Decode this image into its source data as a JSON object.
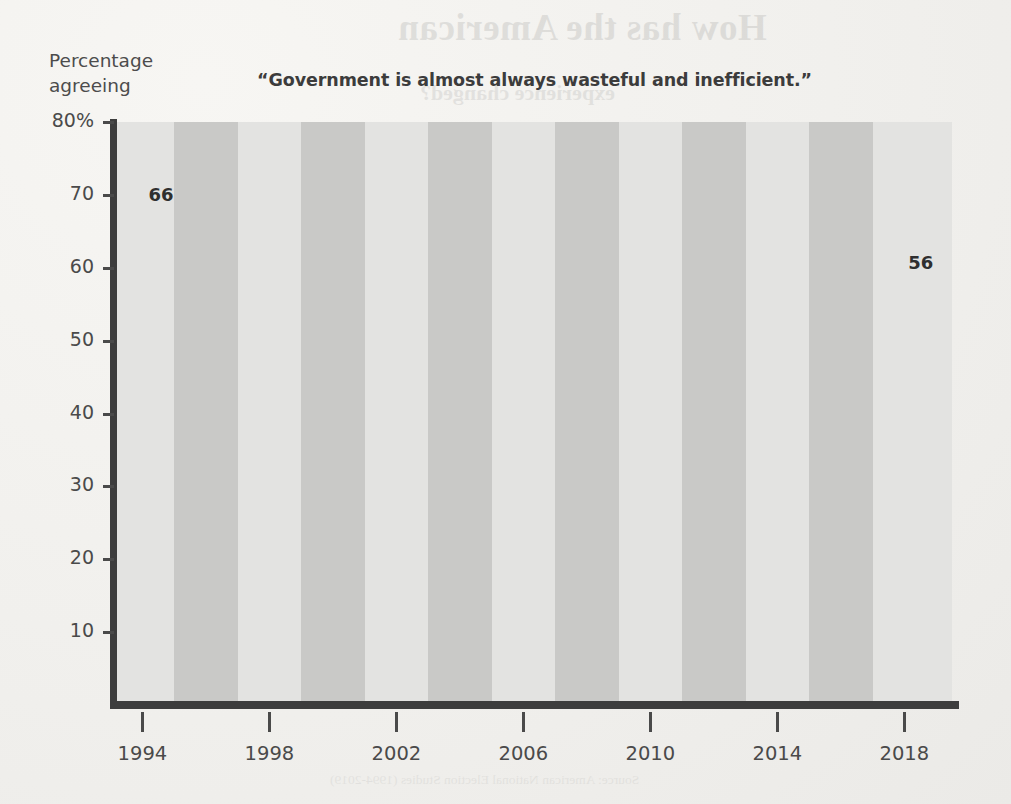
{
  "page": {
    "background_color": "#f3f2ef",
    "ghost_texts": [
      {
        "text": "How has the American",
        "kind": "head",
        "left": 398,
        "top": 6
      },
      {
        "text": "experience changed?",
        "kind": "sub",
        "left": 420,
        "top": 80
      },
      {
        "text": "Americans have long been skeptical of government power.",
        "kind": "body",
        "left": 360,
        "top": 170
      },
      {
        "text": "That skepticism, however, has not been constant over time.",
        "kind": "body",
        "left": 360,
        "top": 192
      },
      {
        "text": "Trust in federal institutions reached a postwar peak in the",
        "kind": "body",
        "left": 360,
        "top": 214
      },
      {
        "text": "mid-1960s and then fell sharply through the 1970s.",
        "kind": "body",
        "left": 360,
        "top": 236
      },
      {
        "text": "Is government wasteful and inefficient?",
        "kind": "sub",
        "left": 370,
        "top": 447
      },
      {
        "text": "Survey researchers have asked a version of this question for",
        "kind": "body",
        "left": 360,
        "top": 505
      },
      {
        "text": "decades, and the responses reveal a persistent majority who",
        "kind": "body",
        "left": 360,
        "top": 527
      },
      {
        "text": "believe that government wastes a great deal of the money",
        "kind": "body",
        "left": 360,
        "top": 549
      },
      {
        "text": "paid in taxes, even as the margin narrows and widens with",
        "kind": "body",
        "left": 360,
        "top": 571
      },
      {
        "text": "the economic and political cycle of each presidency.",
        "kind": "body",
        "left": 360,
        "top": 593
      },
      {
        "text": "Source: American National Election Studies (1994-2019)",
        "kind": "body",
        "left": 330,
        "top": 772
      }
    ]
  },
  "chart_data": {
    "type": "line",
    "title": "“Government is almost always wasteful and inefficient.”",
    "ylabel_line1": "Percentage",
    "ylabel_line2": "agreeing",
    "xlabel": "",
    "grid": false,
    "legend": "none",
    "xlim": [
      1993.2,
      2019.5
    ],
    "ylim": [
      0,
      80
    ],
    "yticks": [
      {
        "value": 80,
        "label": "80%"
      },
      {
        "value": 70,
        "label": "70"
      },
      {
        "value": 60,
        "label": "60"
      },
      {
        "value": 50,
        "label": "50"
      },
      {
        "value": 40,
        "label": "40"
      },
      {
        "value": 30,
        "label": "30"
      },
      {
        "value": 20,
        "label": "20"
      },
      {
        "value": 10,
        "label": "10"
      }
    ],
    "xticks": [
      {
        "value": 1994,
        "label": "1994"
      },
      {
        "value": 1998,
        "label": "1998"
      },
      {
        "value": 2002,
        "label": "2002"
      },
      {
        "value": 2006,
        "label": "2006"
      },
      {
        "value": 2010,
        "label": "2010"
      },
      {
        "value": 2014,
        "label": "2014"
      },
      {
        "value": 2018,
        "label": "2018"
      }
    ],
    "band_color_light": "#e3e3e1",
    "band_color_dark": "#c9c9c7",
    "line_color": "#4a4a4a",
    "line_width": 5,
    "bands": [
      {
        "start": 1993.2,
        "end": 1995.0,
        "shade": "light"
      },
      {
        "start": 1995.0,
        "end": 1997.0,
        "shade": "dark"
      },
      {
        "start": 1997.0,
        "end": 1999.0,
        "shade": "light"
      },
      {
        "start": 1999.0,
        "end": 2001.0,
        "shade": "dark"
      },
      {
        "start": 2001.0,
        "end": 2003.0,
        "shade": "light"
      },
      {
        "start": 2003.0,
        "end": 2005.0,
        "shade": "dark"
      },
      {
        "start": 2005.0,
        "end": 2007.0,
        "shade": "light"
      },
      {
        "start": 2007.0,
        "end": 2009.0,
        "shade": "dark"
      },
      {
        "start": 2009.0,
        "end": 2011.0,
        "shade": "light"
      },
      {
        "start": 2011.0,
        "end": 2013.0,
        "shade": "dark"
      },
      {
        "start": 2013.0,
        "end": 2015.0,
        "shade": "light"
      },
      {
        "start": 2015.0,
        "end": 2017.0,
        "shade": "dark"
      },
      {
        "start": 2017.0,
        "end": 2019.5,
        "shade": "light"
      }
    ],
    "x": [
      1994,
      1995,
      1996,
      1997,
      1999,
      2000,
      2002,
      2004,
      2005,
      2006,
      2008,
      2009,
      2010,
      2011,
      2013,
      2014,
      2015,
      2016,
      2017,
      2019
    ],
    "values": [
      66,
      64,
      56.5,
      59.5,
      52,
      53.5,
      50.5,
      49.2,
      56.5,
      56.8,
      57.8,
      54,
      61,
      56,
      56,
      56.5,
      58,
      55,
      57,
      57
    ],
    "series": [
      {
        "name": "Government is almost always wasteful and inefficient",
        "values": [
          66,
          64,
          56.5,
          59.5,
          52,
          53.5,
          50.5,
          49.2,
          56.5,
          56.8,
          57.8,
          54,
          61,
          56,
          56,
          56.5,
          58,
          55,
          57,
          57
        ]
      }
    ],
    "annotations": [
      {
        "name": "start-value",
        "text": "66",
        "x": 1994,
        "y": 66
      },
      {
        "name": "end-value",
        "text": "56",
        "x": 2019,
        "y": 57
      }
    ]
  }
}
